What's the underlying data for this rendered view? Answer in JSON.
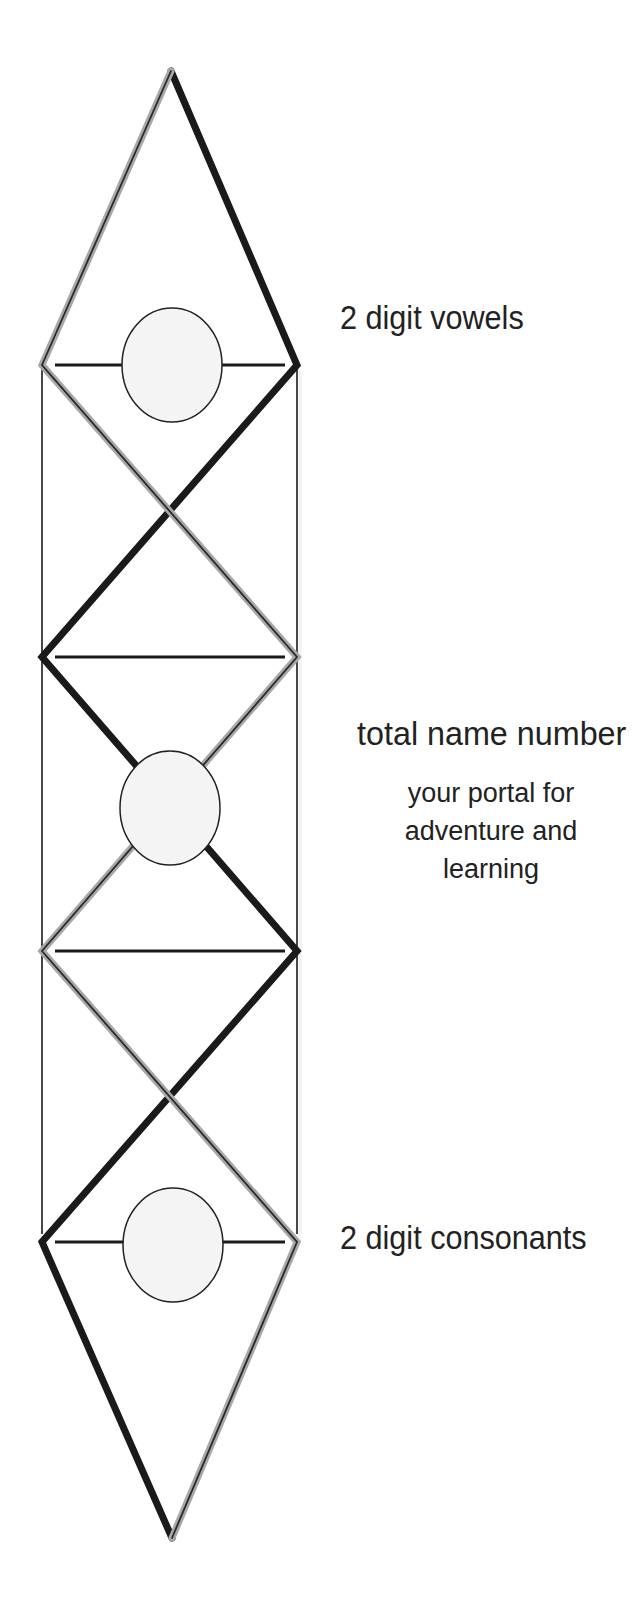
{
  "diagram": {
    "colors": {
      "background": "#ffffff",
      "black_line": "#1a1a1a",
      "gray_line_outer": "#a8a8a8",
      "gray_line_core": "#2a2a2a",
      "thin_line": "#1a1a1a",
      "circle_fill": "#f4f4f4",
      "circle_stroke": "#222222",
      "text": "#222222"
    },
    "nodes": {
      "top_apex": [
        171,
        71
      ],
      "row1_left": [
        42,
        365
      ],
      "row1_right": [
        297,
        365
      ],
      "row2_left": [
        42,
        657
      ],
      "row2_right": [
        297,
        657
      ],
      "row3_left": [
        42,
        951
      ],
      "row3_right": [
        297,
        951
      ],
      "row4_left": [
        42,
        1242
      ],
      "row4_right": [
        297,
        1242
      ],
      "bottom_apex": [
        172,
        1538
      ]
    },
    "circles": [
      {
        "name": "vowels-circle",
        "cx": 172,
        "cy": 365,
        "rx": 50,
        "ry": 57
      },
      {
        "name": "total-circle",
        "cx": 170,
        "cy": 808,
        "rx": 50,
        "ry": 57
      },
      {
        "name": "consonants-circle",
        "cx": 173,
        "cy": 1245,
        "rx": 50,
        "ry": 57
      }
    ]
  },
  "labels": {
    "vowels": "2 digit vowels",
    "total": "total name number",
    "subtext": [
      "your portal for",
      "adventure and",
      "learning"
    ],
    "consonants": "2 digit consonants"
  }
}
